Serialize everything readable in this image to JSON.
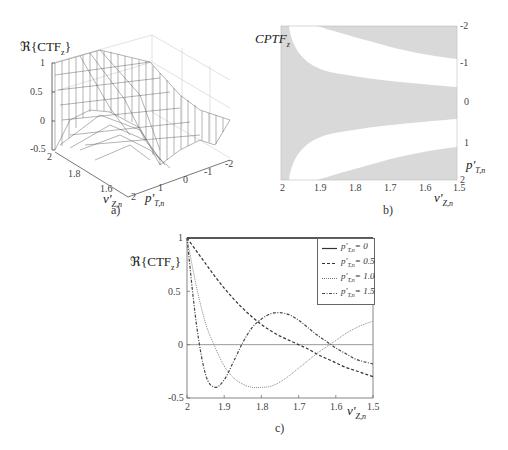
{
  "chart_data": [
    {
      "panel": "a",
      "type": "surface3d",
      "title": "",
      "zlabel": "ℜ{CTF_z}",
      "xlabel": "v'_{Z,n}",
      "ylabel": "p'_{T,n}",
      "z_ticks": [
        "1",
        "0.5",
        "0",
        "-0.5"
      ],
      "x_ticks": [
        "2",
        "1.8",
        "1.6"
      ],
      "y_ticks": [
        "2",
        "1",
        "0",
        "-1",
        "-2"
      ],
      "zlim": [
        -0.5,
        1
      ],
      "xlim": [
        2,
        1.5
      ],
      "ylim": [
        2,
        -2
      ],
      "caption": "a)"
    },
    {
      "panel": "b",
      "type": "heatmap",
      "title": "CPTF_z",
      "xlabel": "v'_{Z,n}",
      "ylabel": "p'_{T,n}",
      "x_ticks": [
        "2",
        "1.9",
        "1.8",
        "1.7",
        "1.6",
        "1.5"
      ],
      "y_ticks": [
        "-2",
        "-1",
        "0",
        "1",
        "2"
      ],
      "xlim": [
        2,
        1.5
      ],
      "ylim": [
        -2,
        2
      ],
      "fill_color": "#d9d9d9",
      "background": "#ffffff",
      "caption": "b)"
    },
    {
      "panel": "c",
      "type": "line",
      "title": "",
      "ylabel": "ℜ{CTF_z}",
      "xlabel": "v'_{Z,n}",
      "x_ticks": [
        "2",
        "1.9",
        "1.8",
        "1.7",
        "1.6",
        "1.5"
      ],
      "y_ticks": [
        "1",
        "0.5",
        "0",
        "-0.5"
      ],
      "xlim": [
        2,
        1.5
      ],
      "ylim": [
        -0.5,
        1
      ],
      "grid": false,
      "legend_position": "upper right",
      "x": [
        2.0,
        1.975,
        1.95,
        1.925,
        1.9,
        1.875,
        1.85,
        1.825,
        1.8,
        1.775,
        1.75,
        1.725,
        1.7,
        1.675,
        1.65,
        1.625,
        1.6,
        1.575,
        1.55,
        1.525,
        1.5
      ],
      "series": [
        {
          "name": "p'_{T,n} = 0",
          "style": "solid",
          "values": [
            1,
            1,
            1,
            1,
            1,
            1,
            1,
            1,
            1,
            1,
            1,
            1,
            1,
            1,
            1,
            1,
            1,
            1,
            1,
            1,
            1
          ]
        },
        {
          "name": "p'_{T,n} = 0.5",
          "style": "dashed",
          "values": [
            1.0,
            0.88,
            0.76,
            0.64,
            0.53,
            0.43,
            0.34,
            0.26,
            0.19,
            0.13,
            0.08,
            0.04,
            0.0,
            -0.04,
            -0.09,
            -0.13,
            -0.17,
            -0.21,
            -0.24,
            -0.27,
            -0.3
          ]
        },
        {
          "name": "p'_{T,n} = 1.0",
          "style": "dotted",
          "values": [
            1.0,
            0.55,
            0.2,
            -0.02,
            -0.2,
            -0.31,
            -0.37,
            -0.4,
            -0.4,
            -0.39,
            -0.35,
            -0.29,
            -0.22,
            -0.15,
            -0.08,
            -0.02,
            0.04,
            0.1,
            0.15,
            0.19,
            0.22
          ]
        },
        {
          "name": "p'_{T,n} = 1.5",
          "style": "dashdot",
          "values": [
            1.0,
            0.2,
            -0.28,
            -0.4,
            -0.33,
            -0.16,
            0.02,
            0.16,
            0.24,
            0.29,
            0.3,
            0.28,
            0.23,
            0.16,
            0.09,
            0.03,
            -0.03,
            -0.08,
            -0.13,
            -0.16,
            -0.18
          ]
        }
      ],
      "caption": "c)"
    }
  ],
  "panels": {
    "a": {
      "zlabel_prefix": "ℜ{CTF",
      "zlabel_sub": "z",
      "zlabel_suffix": "}",
      "z_ticks": [
        "1",
        "0.5",
        "0",
        "-0.5"
      ],
      "x_ticks": [
        "2",
        "1.8",
        "1.6"
      ],
      "y_ticks": [
        "2",
        "1",
        "0",
        "-1",
        "-2"
      ],
      "xlabel_main": "v'",
      "xlabel_sub": "Z,n",
      "ylabel_main": "p'",
      "ylabel_sub": "T,n",
      "caption": "a)"
    },
    "b": {
      "title_main": "CPTF",
      "title_sub": "z",
      "x_ticks": [
        "2",
        "1.9",
        "1.8",
        "1.7",
        "1.6",
        "1.5"
      ],
      "y_ticks": [
        "-2",
        "-1",
        "0",
        "1",
        "2"
      ],
      "xlabel_main": "v'",
      "xlabel_sub": "Z,n",
      "ylabel_main": "p'",
      "ylabel_sub": "T,n",
      "caption": "b)"
    },
    "c": {
      "ylabel_prefix": "ℜ{CTF",
      "ylabel_sub": "z",
      "ylabel_suffix": "}",
      "x_ticks": [
        "2",
        "1.9",
        "1.8",
        "1.7",
        "1.6",
        "1.5"
      ],
      "y_ticks": [
        "1",
        "0.5",
        "0",
        "-0.5"
      ],
      "xlabel_main": "v'",
      "xlabel_sub": "Z,n",
      "legend": [
        {
          "main": "p'",
          "sub": "T,n",
          "value": "= 0"
        },
        {
          "main": "p'",
          "sub": "T,n",
          "value": "= 0.5"
        },
        {
          "main": "p'",
          "sub": "T,n",
          "value": "= 1.0"
        },
        {
          "main": "p'",
          "sub": "T,n",
          "value": "= 1.5"
        }
      ],
      "caption": "c)"
    }
  }
}
